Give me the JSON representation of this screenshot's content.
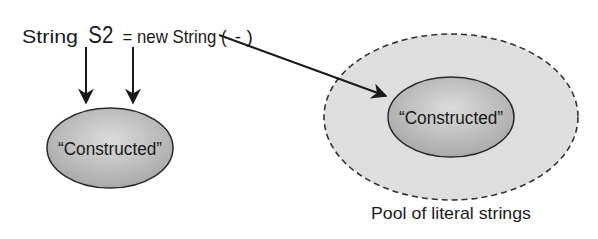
{
  "code_line": {
    "prefix": "String",
    "variable": "S2",
    "suffix": "= new String (",
    "arg_placeholder": "-",
    "close": ")"
  },
  "heap_object": {
    "label": "“Constructed”"
  },
  "pool": {
    "caption": "Pool of literal strings",
    "object_label": "“Constructed”"
  },
  "colors": {
    "ink": "#1a1a1a",
    "ellipse_fill": "#b9b9b9",
    "ellipse_fill_light": "#d9d9d9",
    "pool_fill": "#dedede",
    "pool_stroke": "#333333"
  }
}
